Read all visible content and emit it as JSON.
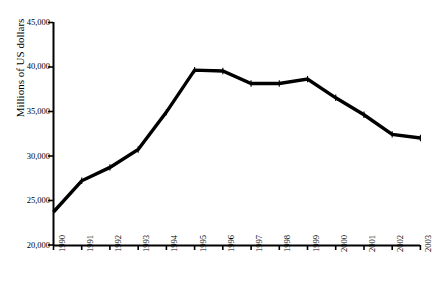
{
  "chart_data": {
    "type": "line",
    "title": "",
    "xlabel": "",
    "ylabel": "Millions of US dollars",
    "categories": [
      "1990",
      "1991",
      "1992",
      "1993",
      "1994",
      "1995",
      "1996",
      "1997",
      "1998",
      "1999",
      "2000",
      "2001",
      "2002",
      "2003"
    ],
    "values": [
      23700,
      27200,
      28700,
      30700,
      34900,
      39600,
      39500,
      38100,
      38100,
      38600,
      36500,
      34600,
      32400,
      32000
    ],
    "series": [
      {
        "name": "Millions of US dollars",
        "values": [
          23700,
          27200,
          28700,
          30700,
          34900,
          39600,
          39500,
          38100,
          38100,
          38600,
          36500,
          34600,
          32400,
          32000
        ]
      }
    ],
    "ylim": [
      20000,
      45000
    ],
    "ytick_values": [
      20000,
      25000,
      30000,
      35000,
      40000,
      45000
    ],
    "ytick_labels": [
      "20,000",
      "25,000",
      "30,000",
      "35,000",
      "40,000",
      "45,000"
    ],
    "xtick_labels": [
      "1990",
      "1991",
      "1992",
      "1993",
      "1994",
      "1995",
      "1996",
      "1997",
      "1998",
      "1999",
      "2000",
      "2001",
      "2002",
      "2003"
    ],
    "grid": false,
    "legend": "none",
    "line_color": "#000000",
    "marker": "plus",
    "axis_color": "#000000"
  }
}
